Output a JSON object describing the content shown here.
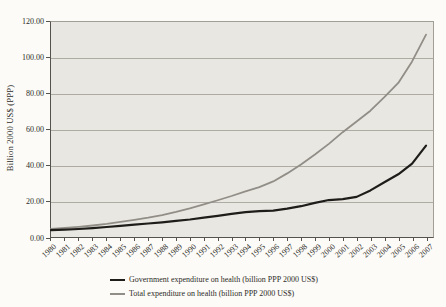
{
  "figure": {
    "y_axis": {
      "title": "Billion 2000 US$ (PPP)",
      "ticks": [
        "120.00",
        "100.00",
        "80.00",
        "60.00",
        "40.00",
        "20.00",
        "0.00"
      ]
    },
    "x_axis": {
      "ticks": [
        "1980",
        "1981",
        "1982",
        "1983",
        "1984",
        "1985",
        "1986",
        "1987",
        "1988",
        "1989",
        "1990",
        "1991",
        "1992",
        "1993",
        "1994",
        "1995",
        "1996",
        "1997",
        "1998",
        "1999",
        "2000",
        "2001",
        "2002",
        "2003",
        "2004",
        "2005",
        "2006",
        "2007"
      ]
    },
    "legend": [
      {
        "label": "Government expenditure on health (billion PPP 2000 US$)",
        "color": "#1f1d1a"
      },
      {
        "label": "Total expenditure on health (billion PPP 2000 US$)",
        "color": "#918e88"
      }
    ],
    "colors": {
      "plot_background": "#e9e7e1",
      "gridline": "#aeaba3",
      "government_line": "#1f1d1a",
      "total_line": "#918e88"
    }
  },
  "chart_data": {
    "type": "line",
    "x": [
      1980,
      1981,
      1982,
      1983,
      1984,
      1985,
      1986,
      1987,
      1988,
      1989,
      1990,
      1991,
      1992,
      1993,
      1994,
      1995,
      1996,
      1997,
      1998,
      1999,
      2000,
      2001,
      2002,
      2003,
      2004,
      2005,
      2006,
      2007
    ],
    "series": [
      {
        "name": "Government expenditure on health (billion PPP 2000 US$)",
        "color": "#1f1d1a",
        "values": [
          3.8,
          4.1,
          4.5,
          5.0,
          5.6,
          6.2,
          6.9,
          7.5,
          8.2,
          9.0,
          9.8,
          10.8,
          11.8,
          12.9,
          13.9,
          14.5,
          14.7,
          15.8,
          17.2,
          19.0,
          20.6,
          21.1,
          22.4,
          26.0,
          30.5,
          35.0,
          41.0,
          51.0
        ]
      },
      {
        "name": "Total expenditure on health (billion PPP 2000 US$)",
        "color": "#918e88",
        "values": [
          4.6,
          5.1,
          5.7,
          6.4,
          7.3,
          8.4,
          9.5,
          10.8,
          12.3,
          14.0,
          16.0,
          18.2,
          20.5,
          22.9,
          25.5,
          27.8,
          31.0,
          35.5,
          40.5,
          46.0,
          52.0,
          58.5,
          64.5,
          70.5,
          78.0,
          86.0,
          98.0,
          113.0
        ]
      }
    ],
    "title": "",
    "xlabel": "",
    "ylabel": "Billion 2000 US$ (PPP)",
    "ylim": [
      0,
      120
    ],
    "y_step": 20,
    "grid": true,
    "legend_position": "bottom"
  }
}
